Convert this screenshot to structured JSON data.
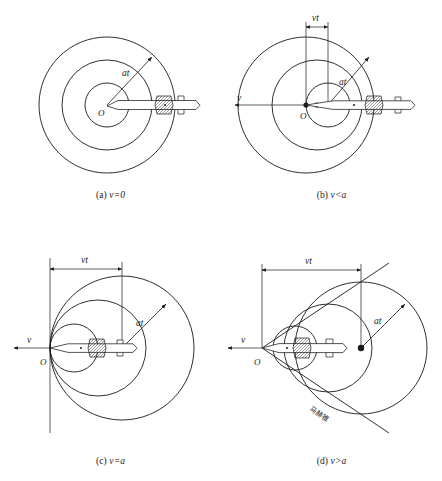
{
  "figure": {
    "background_color": "#ffffff",
    "line_color": "#1a1a1a"
  },
  "labels": {
    "origin": "O",
    "velocity": "v",
    "radius": "at",
    "distance": "vt",
    "mach_cone": "马赫锥"
  },
  "panels": [
    {
      "id": "a",
      "caption_prefix": "(a)",
      "caption_expr": "v=0",
      "caption_full": "(a) v=0",
      "description": "stationary source, concentric circles",
      "origin_label": "O",
      "radius_label": "at",
      "has_vt": false,
      "has_velocity_arrow": false,
      "has_mach_cone": false,
      "circle_count": 3,
      "circle_radii": [
        22,
        45,
        68
      ],
      "center_offsets": [
        0,
        0,
        0
      ]
    },
    {
      "id": "b",
      "caption_prefix": "(b)",
      "caption_expr": "v<a",
      "caption_full": "(b) v<a",
      "description": "subsonic source, nested offset circles",
      "origin_label": "O",
      "radius_label": "at",
      "distance_label": "vt",
      "velocity_label": "v",
      "has_vt": true,
      "has_velocity_arrow": true,
      "has_mach_cone": false,
      "circle_count": 3,
      "circle_radii": [
        22,
        45,
        68
      ],
      "center_offsets": [
        0,
        11,
        22
      ]
    },
    {
      "id": "c",
      "caption_prefix": "(c)",
      "caption_expr": "v=a",
      "caption_full": "(c) v=a",
      "description": "sonic source, circles tangent at origin",
      "origin_label": "O",
      "radius_label": "at",
      "distance_label": "vt",
      "velocity_label": "v",
      "has_vt": true,
      "has_velocity_arrow": true,
      "has_mach_cone": false,
      "circle_count": 3,
      "circle_radii": [
        24,
        48,
        72
      ],
      "center_offsets": [
        24,
        48,
        72
      ]
    },
    {
      "id": "d",
      "caption_prefix": "(d)",
      "caption_expr": "v>a",
      "caption_full": "(d) v>a",
      "description": "supersonic source, Mach cone envelope",
      "origin_label": "O",
      "radius_label": "at",
      "distance_label": "vt",
      "velocity_label": "v",
      "mach_cone_label": "马赫锥",
      "has_vt": true,
      "has_velocity_arrow": true,
      "has_mach_cone": true,
      "circle_count": 3,
      "circle_radii": [
        22,
        44,
        66
      ],
      "center_offsets": [
        33,
        66,
        99
      ]
    }
  ]
}
